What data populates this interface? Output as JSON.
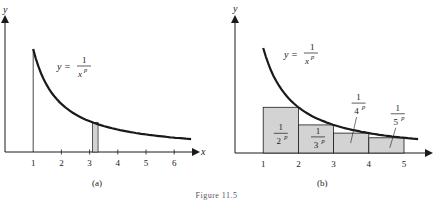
{
  "figure": {
    "caption": "Figure 11.5",
    "colors": {
      "ink": "#1a1a1a",
      "shade": "#d3d3d3"
    }
  },
  "chart_data": [
    {
      "type": "line",
      "panel_label": "(a)",
      "title": "",
      "xlabel": "x",
      "ylabel": "y",
      "curve_label": {
        "lhs": "y =",
        "num": "1",
        "den": "x",
        "exp": "p"
      },
      "x_ticks": [
        "1",
        "2",
        "3",
        "4",
        "5",
        "6"
      ],
      "xlim": [
        0,
        6.8
      ],
      "ylim": [
        0,
        1.1
      ],
      "function": "1/x^p",
      "curve_domain": [
        1,
        6.6
      ],
      "vertical_line_at": 1,
      "shaded_strip": [
        3.1,
        3.3
      ]
    },
    {
      "type": "bar",
      "panel_label": "(b)",
      "title": "",
      "xlabel": "x",
      "ylabel": "y",
      "curve_label": {
        "lhs": "y =",
        "num": "1",
        "den": "x",
        "exp": "p"
      },
      "x_ticks": [
        "1",
        "2",
        "3",
        "4",
        "5"
      ],
      "xlim": [
        0,
        5.5
      ],
      "ylim": [
        0,
        1.1
      ],
      "function": "1/x^p",
      "curve_domain": [
        1,
        5.4
      ],
      "bars": [
        {
          "x0": 1,
          "x1": 2,
          "label_num": "1",
          "label_den": "2",
          "label_exp": "p"
        },
        {
          "x0": 2,
          "x1": 3,
          "label_num": "1",
          "label_den": "3",
          "label_exp": "p"
        },
        {
          "x0": 3,
          "x1": 4,
          "label_num": "1",
          "label_den": "4",
          "label_exp": "p"
        },
        {
          "x0": 4,
          "x1": 5,
          "label_num": "1",
          "label_den": "5",
          "label_exp": "p"
        }
      ]
    }
  ]
}
